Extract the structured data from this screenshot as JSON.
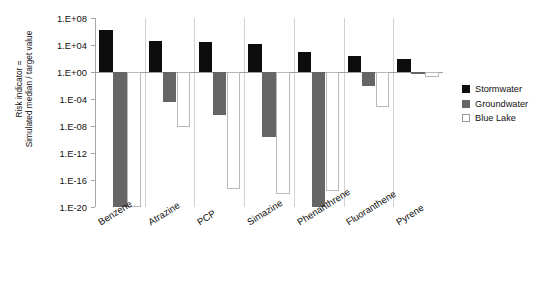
{
  "chart_data": {
    "type": "bar",
    "title": "",
    "xlabel": "",
    "ylabel_line1": "Risk indicator =",
    "ylabel_line2": "Simulated median / target value",
    "scale": "log",
    "ylim": [
      1e-20,
      100000000.0
    ],
    "ytick_labels": [
      "1.E+08",
      "1.E+04",
      "1.E+00",
      "1.E-04",
      "1.E-08",
      "1.E-12",
      "1.E-16",
      "1.E-20"
    ],
    "ytick_exponents": [
      8,
      4,
      0,
      -4,
      -8,
      -12,
      -16,
      -20
    ],
    "grid": false,
    "legend_position": "right",
    "categories": [
      "Benzene",
      "Atrazine",
      "PCP",
      "Simazine",
      "Phenanthrene",
      "Fluoranthene",
      "Pyrene"
    ],
    "series": [
      {
        "name": "Stormwater",
        "color": "#0d0d0d",
        "log_values": [
          6.2,
          4.6,
          4.4,
          4.2,
          2.9,
          2.3,
          1.9
        ],
        "values": [
          1600000.0,
          40000.0,
          25000.0,
          16000.0,
          790.0,
          200.0,
          79.0
        ]
      },
      {
        "name": "Groundwater",
        "color": "#656565",
        "log_values": [
          -20,
          -4.4,
          -6.4,
          -9.6,
          -20,
          -2.1,
          -0.25
        ],
        "values": [
          1e-20,
          4e-05,
          4e-07,
          2.5e-10,
          1e-20,
          0.0079,
          0.56
        ]
      },
      {
        "name": "Blue Lake",
        "color": "#ffffff",
        "log_values": [
          -20,
          -8.2,
          -17.4,
          -18.0,
          -17.6,
          -5.2,
          -0.8
        ],
        "values": [
          1e-20,
          6.3e-09,
          4e-18,
          1e-18,
          2.5e-18,
          6.3e-06,
          0.16
        ]
      }
    ]
  },
  "legend": {
    "items": [
      {
        "label": "Stormwater",
        "swatch": "storm"
      },
      {
        "label": "Groundwater",
        "swatch": "ground"
      },
      {
        "label": "Blue Lake",
        "swatch": "lake"
      }
    ]
  }
}
